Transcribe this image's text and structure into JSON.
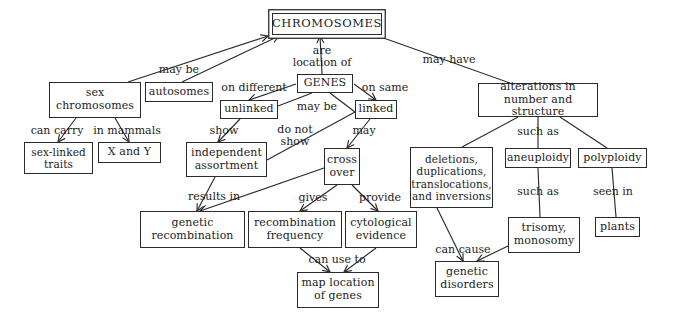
{
  "diagram": {
    "title": "CHROMOSOMES",
    "type": "concept-map",
    "nodes": [
      {
        "id": "chromosomes",
        "label": "CHROMOSOMES",
        "x": 272,
        "y": 13,
        "w": 110,
        "h": 22,
        "font": 11.5,
        "root": true
      },
      {
        "id": "sex_chromosomes",
        "label": "sex\nchromosomes",
        "x": 49,
        "y": 82,
        "w": 92,
        "h": 36,
        "font": 11
      },
      {
        "id": "autosomes",
        "label": "autosomes",
        "x": 145,
        "y": 82,
        "w": 68,
        "h": 20,
        "font": 11
      },
      {
        "id": "sex_linked_traits",
        "label": "sex-linked\ntraits",
        "x": 24,
        "y": 142,
        "w": 69,
        "h": 32,
        "font": 10.5
      },
      {
        "id": "x_and_y",
        "label": "X and Y",
        "x": 98,
        "y": 142,
        "w": 63,
        "h": 21,
        "font": 11
      },
      {
        "id": "genes",
        "label": "GENES",
        "x": 297,
        "y": 74,
        "w": 56,
        "h": 19,
        "font": 11
      },
      {
        "id": "unlinked",
        "label": "unlinked",
        "x": 220,
        "y": 100,
        "w": 58,
        "h": 19,
        "font": 11
      },
      {
        "id": "linked",
        "label": "linked",
        "x": 355,
        "y": 100,
        "w": 42,
        "h": 19,
        "font": 11
      },
      {
        "id": "independent_assortment",
        "label": "independent\nassortment",
        "x": 186,
        "y": 142,
        "w": 81,
        "h": 35,
        "font": 11
      },
      {
        "id": "cross_over",
        "label": "cross\nover",
        "x": 324,
        "y": 148,
        "w": 36,
        "h": 37,
        "font": 11
      },
      {
        "id": "genetic_recombination",
        "label": "genetic\nrecombination",
        "x": 140,
        "y": 211,
        "w": 105,
        "h": 37,
        "font": 11
      },
      {
        "id": "recombination_frequency",
        "label": "recombination\nfrequency",
        "x": 248,
        "y": 211,
        "w": 94,
        "h": 37,
        "font": 11
      },
      {
        "id": "cytological_evidence",
        "label": "cytological\nevidence",
        "x": 345,
        "y": 211,
        "w": 72,
        "h": 37,
        "font": 11
      },
      {
        "id": "map_location_of_genes",
        "label": "map location\nof genes",
        "x": 297,
        "y": 272,
        "w": 82,
        "h": 36,
        "font": 11
      },
      {
        "id": "alterations",
        "label": "alterations in\nnumber and structure",
        "x": 478,
        "y": 83,
        "w": 120,
        "h": 34,
        "font": 11
      },
      {
        "id": "deletions",
        "label": "deletions,\nduplications,\ntranslocations,\nand inversions",
        "x": 410,
        "y": 147,
        "w": 83,
        "h": 61,
        "font": 10.5
      },
      {
        "id": "aneuploidy",
        "label": "aneuploidy",
        "x": 505,
        "y": 148,
        "w": 66,
        "h": 20,
        "font": 11
      },
      {
        "id": "polyploidy",
        "label": "polyploidy",
        "x": 578,
        "y": 148,
        "w": 69,
        "h": 20,
        "font": 11
      },
      {
        "id": "trisomy_monosomy",
        "label": "trisomy,\nmonosomy",
        "x": 508,
        "y": 217,
        "w": 72,
        "h": 36,
        "font": 11
      },
      {
        "id": "plants",
        "label": "plants",
        "x": 595,
        "y": 217,
        "w": 45,
        "h": 20,
        "font": 11
      },
      {
        "id": "genetic_disorders",
        "label": "genetic\ndisorders",
        "x": 435,
        "y": 261,
        "w": 64,
        "h": 36,
        "font": 11
      }
    ],
    "edges": [
      {
        "id": "e-may-be-sex",
        "from": "sex_chromosomes",
        "to": "chromosomes",
        "label": "may be",
        "x1": 128,
        "y1": 82,
        "x2": 268,
        "y2": 36,
        "arrow": true
      },
      {
        "id": "e-may-be-auto",
        "from": "autosomes",
        "to": "chromosomes",
        "label": "",
        "x1": 182,
        "y1": 82,
        "x2": 279,
        "y2": 36,
        "arrow": true
      },
      {
        "id": "e-are-location-of",
        "from": "genes",
        "to": "chromosomes",
        "label": "are\nlocation of",
        "x1": 322,
        "y1": 74,
        "x2": 320,
        "y2": 36,
        "arrow": true
      },
      {
        "id": "e-may-have",
        "from": "alterations",
        "to": "chromosomes",
        "label": "may have",
        "x1": 510,
        "y1": 83,
        "x2": 378,
        "y2": 36,
        "arrow": false
      },
      {
        "id": "e-can-carry",
        "from": "sex_chromosomes",
        "to": "sex_linked_traits",
        "label": "can carry",
        "x1": 76,
        "y1": 118,
        "x2": 58,
        "y2": 142,
        "arrow": true
      },
      {
        "id": "e-in-mammals",
        "from": "sex_chromosomes",
        "to": "x_and_y",
        "label": "in mammals",
        "x1": 115,
        "y1": 118,
        "x2": 129,
        "y2": 142,
        "arrow": true
      },
      {
        "id": "e-on-different",
        "from": "genes",
        "to": "unlinked",
        "label": "on different",
        "x1": 296,
        "y1": 84,
        "x2": 249,
        "y2": 100,
        "arrow": true
      },
      {
        "id": "e-on-same",
        "from": "genes",
        "to": "linked",
        "label": "on same",
        "x1": 354,
        "y1": 84,
        "x2": 376,
        "y2": 100,
        "arrow": true
      },
      {
        "id": "e-may-be-unlinked",
        "from": "unlinked",
        "to": "genes",
        "label": "may be",
        "x1": 278,
        "y1": 106,
        "x2": 312,
        "y2": 93,
        "arrow": false
      },
      {
        "id": "e-may-be-linked",
        "from": "genes",
        "to": "linked",
        "label": "",
        "x1": 330,
        "y1": 93,
        "x2": 355,
        "y2": 112,
        "arrow": false
      },
      {
        "id": "e-show",
        "from": "unlinked",
        "to": "independent_assortment",
        "label": "show",
        "x1": 240,
        "y1": 119,
        "x2": 218,
        "y2": 142,
        "arrow": true
      },
      {
        "id": "e-may",
        "from": "linked",
        "to": "cross_over",
        "label": "may",
        "x1": 370,
        "y1": 119,
        "x2": 347,
        "y2": 148,
        "arrow": true
      },
      {
        "id": "e-do-not-show",
        "from": "linked",
        "to": "independent_assortment",
        "label": "do not\nshow",
        "x1": 355,
        "y1": 112,
        "x2": 267,
        "y2": 160,
        "arrow": false
      },
      {
        "id": "e-results-in",
        "from": "independent_assortment",
        "to": "genetic_recombination",
        "label": "results in",
        "x1": 215,
        "y1": 177,
        "x2": 197,
        "y2": 211,
        "arrow": true
      },
      {
        "id": "e-crossover-recomb",
        "from": "cross_over",
        "to": "genetic_recombination",
        "label": "",
        "x1": 324,
        "y1": 168,
        "x2": 200,
        "y2": 211,
        "arrow": true
      },
      {
        "id": "e-gives",
        "from": "cross_over",
        "to": "recombination_frequency",
        "label": "gives",
        "x1": 337,
        "y1": 185,
        "x2": 300,
        "y2": 211,
        "arrow": true
      },
      {
        "id": "e-provide",
        "from": "cross_over",
        "to": "cytological_evidence",
        "label": "provide",
        "x1": 352,
        "y1": 185,
        "x2": 378,
        "y2": 211,
        "arrow": true
      },
      {
        "id": "e-can-use-to-left",
        "from": "recombination_frequency",
        "to": "map_location_of_genes",
        "label": "can use to",
        "x1": 300,
        "y1": 248,
        "x2": 330,
        "y2": 272,
        "arrow": true
      },
      {
        "id": "e-can-use-to-right",
        "from": "cytological_evidence",
        "to": "map_location_of_genes",
        "label": "",
        "x1": 376,
        "y1": 248,
        "x2": 344,
        "y2": 272,
        "arrow": true
      },
      {
        "id": "e-such-as-deletions",
        "from": "alterations",
        "to": "deletions",
        "label": "such as",
        "x1": 518,
        "y1": 117,
        "x2": 462,
        "y2": 147,
        "arrow": false
      },
      {
        "id": "e-such-as-aneuploidy",
        "from": "alterations",
        "to": "aneuploidy",
        "label": "",
        "x1": 538,
        "y1": 117,
        "x2": 538,
        "y2": 148,
        "arrow": false
      },
      {
        "id": "e-such-as-polyploidy",
        "from": "alterations",
        "to": "polyploidy",
        "label": "",
        "x1": 560,
        "y1": 117,
        "x2": 607,
        "y2": 148,
        "arrow": false
      },
      {
        "id": "e-such-as-trisomy",
        "from": "aneuploidy",
        "to": "trisomy_monosomy",
        "label": "such as",
        "x1": 538,
        "y1": 168,
        "x2": 540,
        "y2": 217,
        "arrow": false
      },
      {
        "id": "e-seen-in",
        "from": "polyploidy",
        "to": "plants",
        "label": "seen in",
        "x1": 612,
        "y1": 168,
        "x2": 616,
        "y2": 217,
        "arrow": false
      },
      {
        "id": "e-can-cause-left",
        "from": "deletions",
        "to": "genetic_disorders",
        "label": "can cause",
        "x1": 437,
        "y1": 208,
        "x2": 463,
        "y2": 261,
        "arrow": true
      },
      {
        "id": "e-can-cause-right",
        "from": "trisomy_monosomy",
        "to": "genetic_disorders",
        "label": "",
        "x1": 508,
        "y1": 246,
        "x2": 477,
        "y2": 261,
        "arrow": true
      }
    ],
    "edge_labels": [
      {
        "id": "lbl-may-be",
        "text": "may be",
        "x": 179,
        "y": 70,
        "font": 11
      },
      {
        "id": "lbl-are-location-of",
        "text": "are\nlocation of",
        "x": 322,
        "y": 57,
        "font": 11
      },
      {
        "id": "lbl-may-have",
        "text": "may have",
        "x": 449,
        "y": 60,
        "font": 11
      },
      {
        "id": "lbl-can-carry",
        "text": "can carry",
        "x": 57,
        "y": 131,
        "font": 11
      },
      {
        "id": "lbl-in-mammals",
        "text": "in mammals",
        "x": 127,
        "y": 131,
        "font": 11
      },
      {
        "id": "lbl-on-different",
        "text": "on different",
        "x": 254,
        "y": 88,
        "font": 11
      },
      {
        "id": "lbl-on-same",
        "text": "on same",
        "x": 385,
        "y": 88,
        "font": 11
      },
      {
        "id": "lbl-may-be-genes",
        "text": "may be",
        "x": 317,
        "y": 107,
        "font": 11
      },
      {
        "id": "lbl-show",
        "text": "show",
        "x": 224,
        "y": 131,
        "font": 11
      },
      {
        "id": "lbl-may",
        "text": "may",
        "x": 364,
        "y": 131,
        "font": 11
      },
      {
        "id": "lbl-do-not-show",
        "text": "do not\nshow",
        "x": 295,
        "y": 136,
        "font": 11
      },
      {
        "id": "lbl-results-in",
        "text": "results in",
        "x": 214,
        "y": 197,
        "font": 11
      },
      {
        "id": "lbl-gives",
        "text": "gives",
        "x": 313,
        "y": 198,
        "font": 11
      },
      {
        "id": "lbl-provide",
        "text": "provide",
        "x": 380,
        "y": 198,
        "font": 11
      },
      {
        "id": "lbl-can-use-to",
        "text": "can use to",
        "x": 337,
        "y": 260,
        "font": 11
      },
      {
        "id": "lbl-such-as-alterations",
        "text": "such as",
        "x": 538,
        "y": 132,
        "font": 11
      },
      {
        "id": "lbl-such-as-aneuploidy",
        "text": "such as",
        "x": 538,
        "y": 192,
        "font": 11
      },
      {
        "id": "lbl-seen-in",
        "text": "seen in",
        "x": 613,
        "y": 192,
        "font": 11
      },
      {
        "id": "lbl-can-cause",
        "text": "can cause",
        "x": 463,
        "y": 250,
        "font": 11
      }
    ]
  }
}
